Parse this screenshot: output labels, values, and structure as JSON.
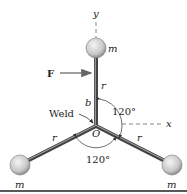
{
  "diagram": {
    "type": "mechanics-figure",
    "labels": {
      "y_axis": "y",
      "x_axis": "x",
      "force": "F",
      "mass_top": "m",
      "mass_left": "m",
      "mass_right": "m",
      "rod_top": "r",
      "rod_left": "r",
      "rod_right": "r",
      "offset": "b",
      "weld": "Weld",
      "origin": "O",
      "angle_upper": "120°",
      "angle_lower": "120°"
    },
    "colors": {
      "rod": "#555555",
      "rod_highlight": "#bbbbbb",
      "ball_light": "#f2f2f2",
      "ball_dark": "#9a9a9a",
      "text": "#222222",
      "dashed_axis": "#888888"
    }
  }
}
